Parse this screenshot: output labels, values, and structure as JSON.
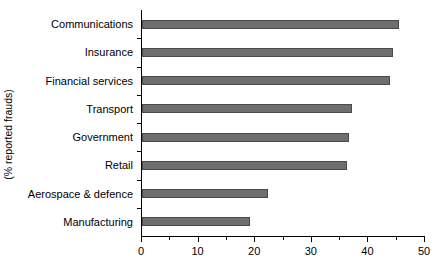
{
  "chart_data": {
    "type": "bar",
    "orientation": "horizontal",
    "title": "",
    "xlabel": "",
    "ylabel": "(% reported frauds)",
    "categories": [
      "Communications",
      "Insurance",
      "Financial services",
      "Transport",
      "Government",
      "Retail",
      "Aerospace & defence",
      "Manufacturing"
    ],
    "values": [
      45.4,
      44.3,
      43.8,
      37.1,
      36.6,
      36.2,
      22.3,
      19.1
    ],
    "xlim": [
      0,
      50
    ],
    "xticks": [
      0,
      10,
      20,
      30,
      40,
      50
    ],
    "xtick_labels": [
      "0",
      "10",
      "20",
      "30",
      "40",
      "50"
    ],
    "xticks_minor": [
      5,
      15,
      25,
      35,
      45
    ],
    "grid": false,
    "legend": false,
    "bar_color": "#6e6e6e",
    "bar_edge_color": "#4a4a4a",
    "axis_color": "#000000",
    "background": "#ffffff"
  }
}
